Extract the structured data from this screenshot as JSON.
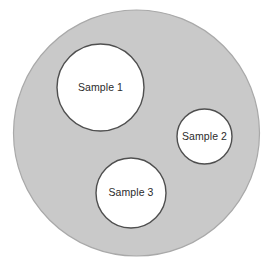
{
  "diagram": {
    "type": "venn-nested-circles",
    "canvas": {
      "width": 271,
      "height": 272,
      "background": "#ffffff"
    },
    "outer": {
      "name": "population-circle",
      "cx": 136.5,
      "cy": 133,
      "r": 123,
      "fill": "#c9c9c9",
      "stroke": "#a9a9a9",
      "stroke_width": 1.2,
      "label": ""
    },
    "samples": [
      {
        "label": "Sample 1",
        "cx": 100.5,
        "cy": 87.5,
        "r": 43.5,
        "fill": "#ffffff",
        "stroke": "#4f4f4f",
        "stroke_width": 1.4
      },
      {
        "label": "Sample 2",
        "cx": 204.5,
        "cy": 136.5,
        "r": 27.5,
        "fill": "#ffffff",
        "stroke": "#4f4f4f",
        "stroke_width": 1.4
      },
      {
        "label": "Sample 3",
        "cx": 131,
        "cy": 193,
        "r": 35,
        "fill": "#ffffff",
        "stroke": "#4f4f4f",
        "stroke_width": 1.4
      }
    ]
  },
  "chart_data": {
    "type": "diagram",
    "title": "",
    "subtitle": "",
    "xlabel": "",
    "ylabel": "",
    "legend": [],
    "annotations": [
      "Sample 1",
      "Sample 2",
      "Sample 3"
    ],
    "categories": [
      "Sample 1",
      "Sample 2",
      "Sample 3"
    ],
    "values": [
      43.5,
      27.5,
      35
    ]
  }
}
